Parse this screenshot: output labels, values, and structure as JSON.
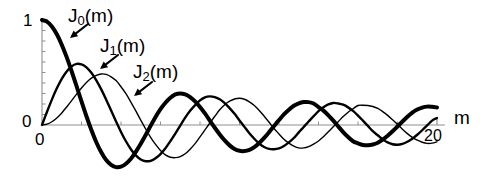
{
  "figure": {
    "background_color": "#ffffff",
    "axis_color": "#8f8f8f",
    "curve_color": "#000000"
  },
  "axes": {
    "x_axis_name": "m",
    "x_tick_labels": [
      "0",
      "20"
    ],
    "x_tick_values": [
      0,
      20
    ],
    "y_tick_labels": [
      "0",
      "1"
    ],
    "y_tick_values": [
      0,
      1
    ],
    "x_label_origin": "0",
    "x_label_end": "20",
    "y_label_zero": "0",
    "y_label_one": "1",
    "xlim": [
      0,
      20.4
    ],
    "ylim": [
      -0.5,
      1.05
    ],
    "grid": false,
    "minor_ticks_x": 10,
    "minor_ticks_y": 10
  },
  "annotations": {
    "j0": {
      "text_main": "J",
      "text_sub": "0",
      "text_tail": "(m)",
      "full": "J0(m)"
    },
    "j1": {
      "text_main": "J",
      "text_sub": "1",
      "text_tail": "(m)",
      "full": "J1(m)"
    },
    "j2": {
      "text_main": "J",
      "text_sub": "2",
      "text_tail": "(m)",
      "full": "J2(m)"
    }
  },
  "chart_data": {
    "type": "line",
    "title": "",
    "subtitle": "",
    "xlabel": "m",
    "ylabel": "",
    "xlim": [
      0,
      20.4
    ],
    "ylim": [
      -0.5,
      1.05
    ],
    "grid": false,
    "legend_position": "inline-annotations",
    "xticks": [
      0,
      20
    ],
    "xticklabels": [
      "0",
      "20"
    ],
    "yticks": [
      0,
      1
    ],
    "yticklabels": [
      "0",
      "1"
    ],
    "series": [
      {
        "name": "J0(m)",
        "label": "J0(m)",
        "linewidth": 4.0,
        "color": "#000000",
        "x": [
          0,
          0.25,
          0.5,
          0.75,
          1,
          1.25,
          1.5,
          1.75,
          2,
          2.25,
          2.5,
          2.75,
          3,
          3.25,
          3.5,
          3.75,
          4,
          4.25,
          4.5,
          4.75,
          5,
          5.25,
          5.5,
          5.75,
          6,
          6.25,
          6.5,
          6.75,
          7,
          7.25,
          7.5,
          7.75,
          8,
          8.25,
          8.5,
          8.75,
          9,
          9.25,
          9.5,
          9.75,
          10,
          10.25,
          10.5,
          10.75,
          11,
          11.25,
          11.5,
          11.75,
          12,
          12.25,
          12.5,
          12.75,
          13,
          13.25,
          13.5,
          13.75,
          14,
          14.25,
          14.5,
          14.75,
          15,
          15.25,
          15.5,
          15.75,
          16,
          16.25,
          16.5,
          16.75,
          17,
          17.25,
          17.5,
          17.75,
          18,
          18.25,
          18.5,
          18.75,
          19,
          19.25,
          19.5,
          19.75,
          20
        ],
        "y": [
          1.0,
          0.984,
          0.938,
          0.864,
          0.765,
          0.646,
          0.512,
          0.37,
          0.224,
          0.083,
          -0.048,
          -0.164,
          -0.26,
          -0.334,
          -0.38,
          -0.401,
          -0.397,
          -0.369,
          -0.321,
          -0.255,
          -0.178,
          -0.095,
          -0.007,
          0.077,
          0.151,
          0.212,
          0.26,
          0.291,
          0.3,
          0.291,
          0.266,
          0.225,
          0.172,
          0.11,
          0.042,
          -0.026,
          -0.09,
          -0.147,
          -0.194,
          -0.229,
          -0.246,
          -0.248,
          -0.237,
          -0.211,
          -0.171,
          -0.123,
          -0.068,
          -0.01,
          0.047,
          0.101,
          0.146,
          0.183,
          0.207,
          0.219,
          0.218,
          0.205,
          0.171,
          0.137,
          0.092,
          0.041,
          -0.014,
          -0.067,
          -0.115,
          -0.155,
          -0.175,
          -0.19,
          -0.193,
          -0.186,
          -0.169,
          -0.139,
          -0.102,
          -0.06,
          -0.014,
          0.033,
          0.078,
          0.118,
          0.147,
          0.166,
          0.175,
          0.173,
          0.167
        ]
      },
      {
        "name": "J1(m)",
        "label": "J1(m)",
        "linewidth": 2.4,
        "color": "#000000",
        "x": [
          0,
          0.25,
          0.5,
          0.75,
          1,
          1.25,
          1.5,
          1.75,
          2,
          2.25,
          2.5,
          2.75,
          3,
          3.25,
          3.5,
          3.75,
          4,
          4.25,
          4.5,
          4.75,
          5,
          5.25,
          5.5,
          5.75,
          6,
          6.25,
          6.5,
          6.75,
          7,
          7.25,
          7.5,
          7.75,
          8,
          8.25,
          8.5,
          8.75,
          9,
          9.25,
          9.5,
          9.75,
          10,
          10.25,
          10.5,
          10.75,
          11,
          11.25,
          11.5,
          11.75,
          12,
          12.25,
          12.5,
          12.75,
          13,
          13.25,
          13.5,
          13.75,
          14,
          14.25,
          14.5,
          14.75,
          15,
          15.25,
          15.5,
          15.75,
          16,
          16.25,
          16.5,
          16.75,
          17,
          17.25,
          17.5,
          17.75,
          18,
          18.25,
          18.5,
          18.75,
          19,
          19.25,
          19.5,
          19.75,
          20
        ],
        "y": [
          0.0,
          0.124,
          0.242,
          0.349,
          0.44,
          0.51,
          0.558,
          0.582,
          0.577,
          0.549,
          0.497,
          0.425,
          0.339,
          0.241,
          0.137,
          0.034,
          -0.066,
          -0.155,
          -0.231,
          -0.29,
          -0.328,
          -0.345,
          -0.341,
          -0.317,
          -0.277,
          -0.221,
          -0.154,
          -0.083,
          -0.005,
          0.07,
          0.135,
          0.188,
          0.235,
          0.264,
          0.273,
          0.266,
          0.245,
          0.209,
          0.161,
          0.106,
          0.043,
          -0.018,
          -0.079,
          -0.131,
          -0.177,
          -0.209,
          -0.228,
          -0.231,
          -0.223,
          -0.2,
          -0.166,
          -0.124,
          -0.07,
          -0.019,
          0.033,
          0.083,
          0.133,
          0.169,
          0.196,
          0.21,
          0.205,
          0.193,
          0.168,
          0.134,
          0.09,
          0.041,
          -0.009,
          -0.059,
          -0.098,
          -0.137,
          -0.166,
          -0.183,
          -0.188,
          -0.18,
          -0.16,
          -0.13,
          -0.093,
          -0.05,
          -0.004,
          0.042,
          0.067
        ]
      },
      {
        "name": "J2(m)",
        "label": "J2(m)",
        "linewidth": 1.4,
        "color": "#000000",
        "x": [
          0,
          0.25,
          0.5,
          0.75,
          1,
          1.25,
          1.5,
          1.75,
          2,
          2.25,
          2.5,
          2.75,
          3,
          3.25,
          3.5,
          3.75,
          4,
          4.25,
          4.5,
          4.75,
          5,
          5.25,
          5.5,
          5.75,
          6,
          6.25,
          6.5,
          6.75,
          7,
          7.25,
          7.5,
          7.75,
          8,
          8.25,
          8.5,
          8.75,
          9,
          9.25,
          9.5,
          9.75,
          10,
          10.25,
          10.5,
          10.75,
          11,
          11.25,
          11.5,
          11.75,
          12,
          12.25,
          12.5,
          12.75,
          13,
          13.25,
          13.5,
          13.75,
          14,
          14.25,
          14.5,
          14.75,
          15,
          15.25,
          15.5,
          15.75,
          16,
          16.25,
          16.5,
          16.75,
          17,
          17.25,
          17.5,
          17.75,
          18,
          18.25,
          18.5,
          18.75,
          19,
          19.25,
          19.5,
          19.75,
          20
        ],
        "y": [
          0.0,
          0.008,
          0.031,
          0.067,
          0.115,
          0.172,
          0.232,
          0.294,
          0.353,
          0.405,
          0.446,
          0.473,
          0.486,
          0.482,
          0.459,
          0.423,
          0.364,
          0.298,
          0.218,
          0.134,
          0.047,
          -0.038,
          -0.117,
          -0.185,
          -0.243,
          -0.285,
          -0.307,
          -0.311,
          -0.301,
          -0.274,
          -0.23,
          -0.177,
          -0.113,
          -0.047,
          0.019,
          0.083,
          0.145,
          0.193,
          0.227,
          0.248,
          0.255,
          0.245,
          0.221,
          0.186,
          0.139,
          0.084,
          0.026,
          -0.033,
          -0.085,
          -0.136,
          -0.173,
          -0.201,
          -0.218,
          -0.218,
          -0.205,
          -0.182,
          -0.152,
          -0.111,
          -0.065,
          -0.016,
          0.032,
          0.08,
          0.122,
          0.155,
          0.186,
          0.188,
          0.186,
          0.176,
          0.158,
          0.128,
          0.092,
          0.05,
          0.006,
          -0.04,
          -0.082,
          -0.118,
          -0.145,
          -0.164,
          -0.175,
          -0.173,
          -0.16
        ]
      }
    ]
  }
}
